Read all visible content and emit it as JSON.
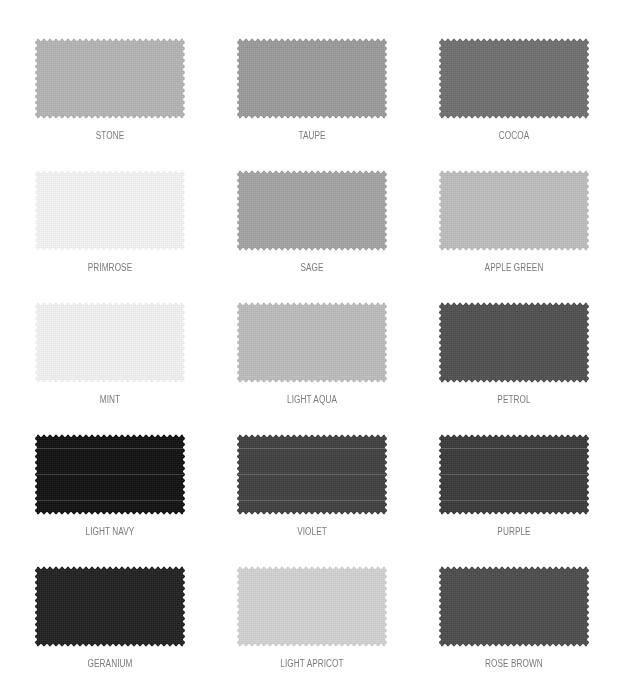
{
  "swatches": [
    {
      "name": "STONE",
      "color": "#b4b4b4",
      "streaks": false
    },
    {
      "name": "TAUPE",
      "color": "#9a9a9a",
      "streaks": false
    },
    {
      "name": "COCOA",
      "color": "#6e6e6e",
      "streaks": false
    },
    {
      "name": "PRIMROSE",
      "color": "#f5f5f5",
      "streaks": false
    },
    {
      "name": "SAGE",
      "color": "#a3a3a3",
      "streaks": false
    },
    {
      "name": "APPLE GREEN",
      "color": "#bdbdbd",
      "streaks": false
    },
    {
      "name": "MINT",
      "color": "#f3f3f3",
      "streaks": false
    },
    {
      "name": "LIGHT AQUA",
      "color": "#bcbcbc",
      "streaks": false
    },
    {
      "name": "PETROL",
      "color": "#4e4e4e",
      "streaks": false
    },
    {
      "name": "LIGHT NAVY",
      "color": "#0e0e0e",
      "streaks": true
    },
    {
      "name": "VIOLET",
      "color": "#3e3e3e",
      "streaks": true
    },
    {
      "name": "PURPLE",
      "color": "#383838",
      "streaks": true
    },
    {
      "name": "GERANIUM",
      "color": "#1e1e1e",
      "streaks": false
    },
    {
      "name": "LIGHT APRICOT",
      "color": "#d2d2d2",
      "streaks": false
    },
    {
      "name": "ROSE BROWN",
      "color": "#4a4a4a",
      "streaks": false
    }
  ]
}
